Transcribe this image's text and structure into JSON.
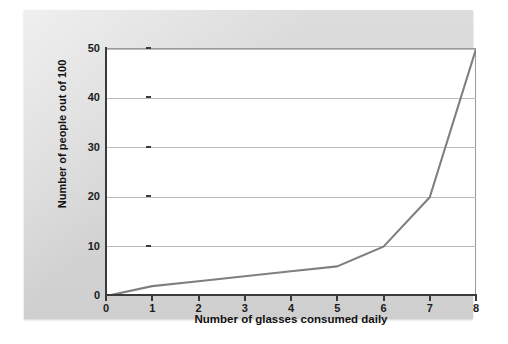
{
  "chart_data": {
    "type": "line",
    "title": "",
    "xlabel": "Number of glasses consumed daily",
    "ylabel": "Number of people out of 100",
    "x": [
      0,
      1,
      2,
      3,
      4,
      5,
      6,
      7,
      8
    ],
    "values": [
      0,
      2,
      3,
      4,
      5,
      6,
      10,
      20,
      50
    ],
    "series": [
      {
        "name": "Number of people out of 100",
        "values": [
          0,
          2,
          3,
          4,
          5,
          6,
          10,
          20,
          50
        ]
      }
    ],
    "xlim": [
      0,
      8
    ],
    "ylim": [
      0,
      50
    ],
    "xticks": [
      "0",
      "1",
      "2",
      "3",
      "4",
      "5",
      "6",
      "7",
      "8"
    ],
    "yticks": [
      "0",
      "10",
      "20",
      "30",
      "40",
      "50"
    ],
    "xtick_values": [
      0,
      1,
      2,
      3,
      4,
      5,
      6,
      7,
      8
    ],
    "ytick_values": [
      0,
      10,
      20,
      30,
      40,
      50
    ],
    "grid": "horizontal",
    "legend": "none",
    "line_color": "#7f7f7f",
    "plot_background": "#ffffff",
    "panel_background": "#d9d9d9",
    "axis_color": "#3a3a3a",
    "gridline_color": "#bdbdbd"
  }
}
